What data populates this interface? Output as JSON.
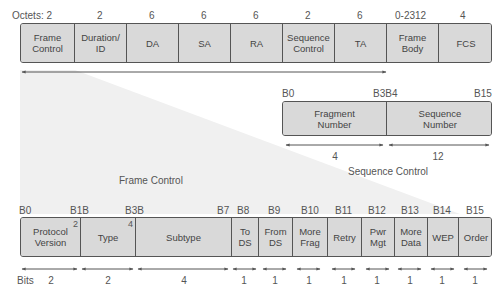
{
  "diagram": {
    "title_hint": "802.11 MAC frame format",
    "colors": {
      "field_fill": "#d9d9d9",
      "border": "#555555",
      "wedge": "#efefef",
      "text": "#444444"
    }
  },
  "frame": {
    "octets_label": "Octets: 2",
    "fields": [
      {
        "name": "Frame\nControl",
        "octets": "2"
      },
      {
        "name": "Duration/\nID",
        "octets": "2"
      },
      {
        "name": "DA",
        "octets": "6"
      },
      {
        "name": "SA",
        "octets": "6"
      },
      {
        "name": "RA",
        "octets": "6"
      },
      {
        "name": "Sequence\nControl",
        "octets": "2"
      },
      {
        "name": "TA",
        "octets": "6"
      },
      {
        "name": "Frame\nBody",
        "octets": "0-2312"
      },
      {
        "name": "FCS",
        "octets": "4"
      }
    ]
  },
  "sequence_control": {
    "title": "Sequence Control",
    "bit_labels": {
      "start": "B0",
      "mid": "B3B4",
      "end": "B15"
    },
    "fields": [
      {
        "name": "Fragment\nNumber",
        "bits": "4"
      },
      {
        "name": "Sequence\nNumber",
        "bits": "12"
      }
    ]
  },
  "frame_control": {
    "title": "Frame Control",
    "bits_label": "Bits",
    "bit_positions": [
      "B0",
      "B1B",
      "B3B",
      "B7",
      "B8",
      "B9",
      "B10",
      "B11",
      "B12",
      "B13",
      "B14",
      "B15"
    ],
    "fields": [
      {
        "name": "Protocol\nVersion",
        "bits": "2",
        "sup": "2"
      },
      {
        "name": "Type",
        "bits": "2",
        "sup": "4"
      },
      {
        "name": "Subtype",
        "bits": "4",
        "sup": ""
      },
      {
        "name": "To\nDS",
        "bits": "1",
        "sup": ""
      },
      {
        "name": "From\nDS",
        "bits": "1",
        "sup": ""
      },
      {
        "name": "More\nFrag",
        "bits": "1",
        "sup": ""
      },
      {
        "name": "Retry",
        "bits": "1",
        "sup": ""
      },
      {
        "name": "Pwr\nMgt",
        "bits": "1",
        "sup": ""
      },
      {
        "name": "More\nData",
        "bits": "1",
        "sup": ""
      },
      {
        "name": "WEP",
        "bits": "1",
        "sup": ""
      },
      {
        "name": "Order",
        "bits": "1",
        "sup": ""
      }
    ]
  }
}
